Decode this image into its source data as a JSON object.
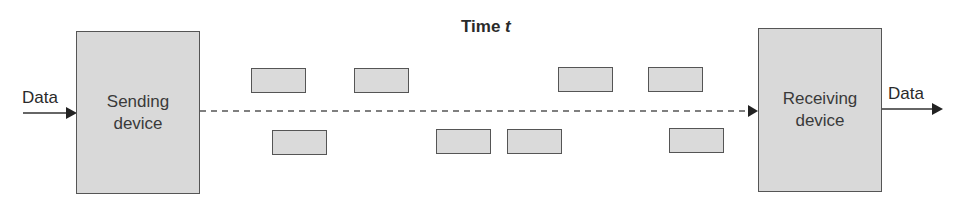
{
  "diagram": {
    "title": "Time",
    "title_variable": "t",
    "input_label": "Data",
    "output_label": "Data",
    "sender": {
      "line1": "Sending",
      "line2": "device"
    },
    "receiver": {
      "line1": "Receiving",
      "line2": "device"
    },
    "packets_top_count": 4,
    "packets_bottom_count": 4,
    "colors": {
      "box_fill": "#d9d9d9",
      "border": "#555555",
      "line": "#555555",
      "text": "#2a2a2a"
    }
  }
}
